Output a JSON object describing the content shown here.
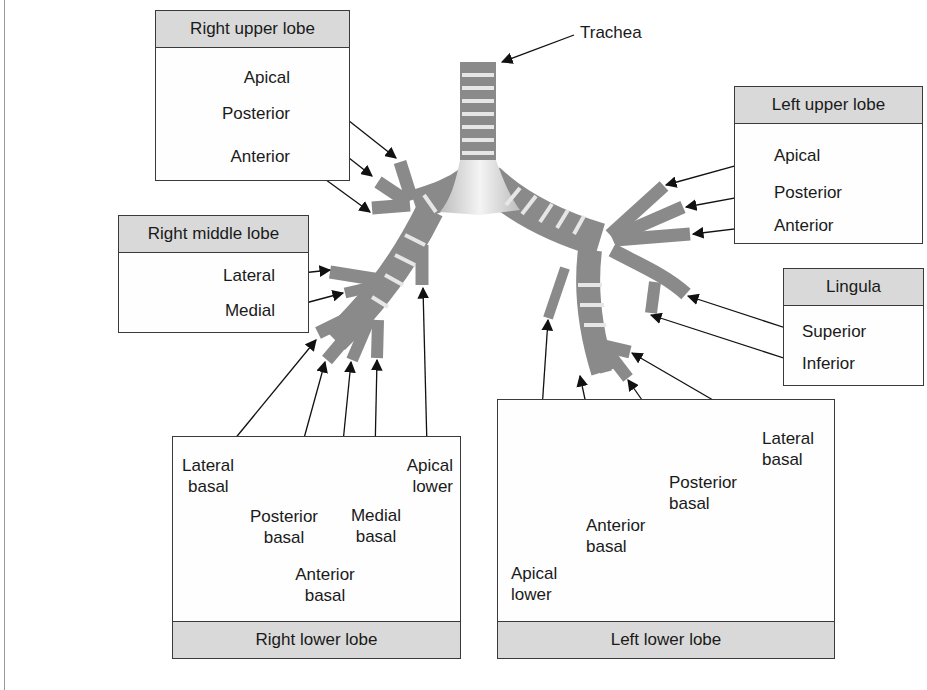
{
  "diagram": {
    "trachea_label": "Trachea",
    "right_upper_lobe": {
      "title": "Right upper lobe",
      "segments": [
        "Apical",
        "Posterior",
        "Anterior"
      ]
    },
    "right_middle_lobe": {
      "title": "Right middle lobe",
      "segments": [
        "Lateral",
        "Medial"
      ]
    },
    "right_lower_lobe": {
      "title": "Right lower lobe",
      "segments": {
        "lateral_basal": [
          "Lateral",
          "basal"
        ],
        "posterior_basal": [
          "Posterior",
          "basal"
        ],
        "anterior_basal": [
          "Anterior",
          "basal"
        ],
        "medial_basal": [
          "Medial",
          "basal"
        ],
        "apical_lower": [
          "Apical",
          "lower"
        ]
      }
    },
    "left_upper_lobe": {
      "title": "Left upper lobe",
      "segments": [
        "Apical",
        "Posterior",
        "Anterior"
      ]
    },
    "lingula": {
      "title": "Lingula",
      "segments": [
        "Superior",
        "Inferior"
      ]
    },
    "left_lower_lobe": {
      "title": "Left lower lobe",
      "segments": {
        "lateral_basal": [
          "Lateral",
          "basal"
        ],
        "posterior_basal": [
          "Posterior",
          "basal"
        ],
        "anterior_basal": [
          "Anterior",
          "basal"
        ],
        "apical_lower": [
          "Apical",
          "lower"
        ]
      }
    },
    "colors": {
      "airway": "#8a8a8a",
      "cartilage_ring": "#e6e6e6",
      "header_fill": "#d9d9d9",
      "border": "#3a3a3a"
    }
  }
}
